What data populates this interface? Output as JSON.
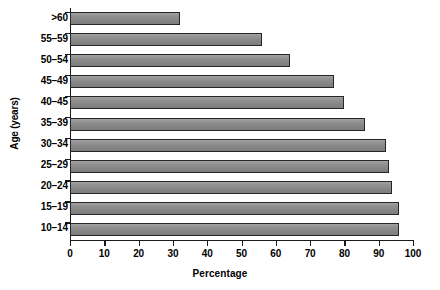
{
  "chart_data": {
    "type": "bar",
    "orientation": "horizontal",
    "title": "",
    "xlabel": "Percentage",
    "ylabel": "Age (years)",
    "categories": [
      "10–14",
      "15–19",
      "20–24",
      "25–29",
      "30–34",
      "35–39",
      "40–45",
      "45–49",
      "50–54",
      "55–59",
      ">60"
    ],
    "values": [
      96,
      96,
      94,
      93,
      92,
      86,
      80,
      77,
      64,
      56,
      32
    ],
    "xlim": [
      0,
      100
    ],
    "xticks": [
      0,
      10,
      20,
      30,
      40,
      50,
      60,
      70,
      80,
      90,
      100
    ],
    "xtick_labels": [
      "0",
      "10",
      "20",
      "30",
      "40",
      "50",
      "60",
      "70",
      "80",
      "90",
      "100"
    ],
    "grid": false,
    "legend": null,
    "bar_color": "#8b8b8b",
    "bar_edge_color": "#262626",
    "axis_color": "#1a1a1a",
    "background": "#ffffff"
  }
}
